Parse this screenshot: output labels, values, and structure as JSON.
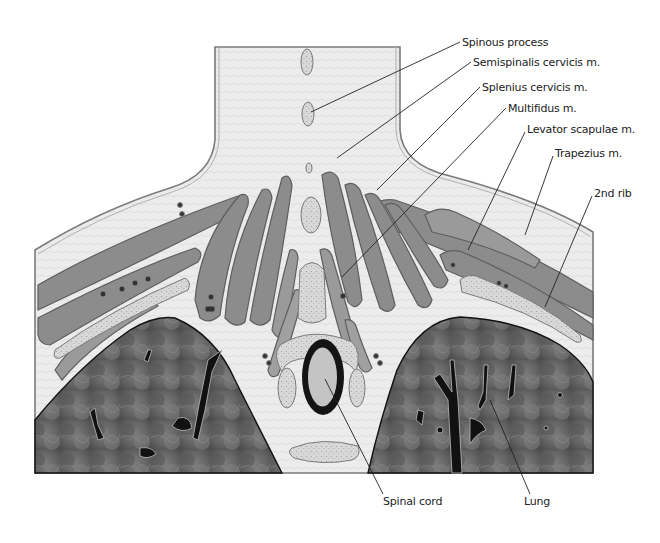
{
  "figure": {
    "colors": {
      "background": "#ffffff",
      "tissue": "#ebebeb",
      "tissue_stroke": "#8a8a8a",
      "muscle": "#8c8c8c",
      "muscle_light": "#a6a6a6",
      "muscle_stroke": "#5e5e5e",
      "bone": "#d6d6d6",
      "bone_stroke": "#7a7a7a",
      "lung": "#6a6a6a",
      "lung_dark": "#4a4a4a",
      "airway": "#111111",
      "cord_ring": "#141414",
      "cord_fill": "#c4c4c4",
      "leader": "#222222"
    }
  },
  "labels": [
    {
      "id": "spinous-process",
      "text": "Spinous process",
      "x": 462,
      "y": 36,
      "line": [
        [
          460,
          42
        ],
        [
          311,
          112
        ]
      ]
    },
    {
      "id": "semispinalis-cervicis",
      "text": "Semispinalis cervicis m.",
      "x": 473,
      "y": 56,
      "line": [
        [
          471,
          62
        ],
        [
          337,
          158
        ]
      ]
    },
    {
      "id": "splenius-cervicis",
      "text": "Splenius cervicis m.",
      "x": 482,
      "y": 81,
      "line": [
        [
          480,
          87
        ],
        [
          377,
          190
        ]
      ]
    },
    {
      "id": "multifidus",
      "text": "Multifidus m.",
      "x": 508,
      "y": 102,
      "line": [
        [
          506,
          108
        ],
        [
          342,
          277
        ]
      ]
    },
    {
      "id": "levator-scapulae",
      "text": "Levator scapulae m.",
      "x": 527,
      "y": 123,
      "line": [
        [
          525,
          132
        ],
        [
          468,
          250
        ]
      ]
    },
    {
      "id": "trapezius",
      "text": "Trapezius m.",
      "x": 555,
      "y": 147,
      "line": [
        [
          553,
          156
        ],
        [
          525,
          235
        ]
      ]
    },
    {
      "id": "second-rib",
      "text": "2nd rib",
      "x": 594,
      "y": 187,
      "line": [
        [
          592,
          196
        ],
        [
          545,
          307
        ]
      ]
    },
    {
      "id": "spinal-cord",
      "text": "Spinal cord",
      "x": 383,
      "y": 495,
      "line": [
        [
          325,
          379
        ],
        [
          383,
          494
        ]
      ]
    },
    {
      "id": "lung",
      "text": "Lung",
      "x": 524,
      "y": 495,
      "line": [
        [
          490,
          400
        ],
        [
          530,
          494
        ]
      ]
    }
  ]
}
